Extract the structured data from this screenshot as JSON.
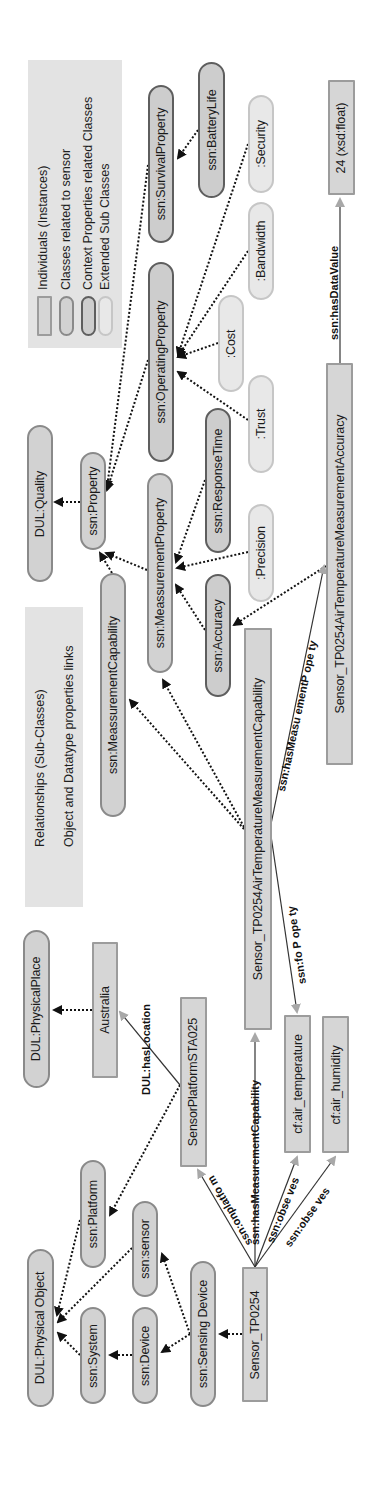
{
  "legend_nodes": {
    "items": [
      {
        "label": "Individuals (Instances)",
        "style": "individual",
        "fill": "#d6d6d6",
        "border": "#9c9c9c"
      },
      {
        "label": "Classes related to sensor",
        "style": "class",
        "fill": "#d2d2d2",
        "border": "#8a8a8a"
      },
      {
        "label": "Context Properties related Classes",
        "style": "context",
        "fill": "#cdcdcd",
        "border": "#5e5e5e"
      },
      {
        "label": "Extended Sub Classes",
        "style": "extended",
        "fill": "#e8e8e8",
        "border": "#c6c6c6"
      }
    ]
  },
  "legend_links": {
    "items": [
      {
        "label": "Relationships (Sub-Classes)",
        "style": "dotted-black-arrow"
      },
      {
        "label": "Object and Datatype properties links",
        "style": "solid-gray-arrow"
      }
    ]
  },
  "nodes": {
    "dul_quality": "DUL:Quality",
    "ssn_property": "ssn:Property",
    "ssn_measurement_capability": "ssn:MeassurementCapability",
    "ssn_measurement_property": "ssn:MeassurementProperty",
    "ssn_response_time": "ssn:ResponseTime",
    "ssn_accuracy": "ssn:Accuracy",
    "precision": ":Precision",
    "trust": ":Trust",
    "ssn_operating_property": "ssn:OperatingProperty",
    "cost": ":Cost",
    "bandwidth": ":Bandwidth",
    "security": ":Security",
    "ssn_survival_property": "ssn:SurvivalProperty",
    "ssn_battery_life": "ssn:BatteryLife",
    "data_value": "24 (xsd:float)",
    "accuracy_individual": "Sensor_TP0254AirTemperatureMeasurementAccuracy",
    "capability_individual": "Sensor_TP0254AirTemperatureMeasurementCapability",
    "dul_physical_place": "DUL:PhysicalPlace",
    "australia": "Australia",
    "sensor_platform": "SensorPlatformSTA025",
    "cf_air_temperature": "cf:air_temperature",
    "cf_air_humidity": "cf:air_humidity",
    "dul_physical_object": "DUL:Physical Object",
    "ssn_platform": "ssn:Platform",
    "ssn_sensor": "ssn:sensor",
    "ssn_system": "ssn:System",
    "ssn_device": "ssn:Device",
    "ssn_sensing_device": "ssn:Sensing Device",
    "sensor_tp0254": "Sensor_TP0254"
  },
  "edge_labels": {
    "has_data_value": "ssn:hasDataValue",
    "has_measurement_property": "ssn:hasMeasu ementP ope ty",
    "for_property": "ssn:fo P ope ty",
    "has_location": "DUL:hasLocation",
    "on_platform": "ssn:onplatfo m",
    "has_measurement_capability": "ssn:hasMeasurementCapability",
    "observes_1": "ssn:obse ves",
    "observes_2": "ssn:obse ves"
  },
  "colors": {
    "subclass_edge": "#111111",
    "property_edge": "#333333",
    "property_arrowhead": "#a8a8a8",
    "legend_bg": "#e3e3e3"
  }
}
